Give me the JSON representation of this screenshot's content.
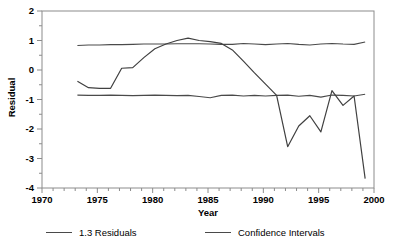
{
  "chart_data": {
    "type": "line",
    "title": "",
    "xlabel": "Year",
    "ylabel": "Residual",
    "xlim": [
      1970,
      2000
    ],
    "ylim": [
      -4,
      2
    ],
    "xticks": [
      1970,
      1975,
      1980,
      1985,
      1990,
      1995,
      2000
    ],
    "yticks": [
      2,
      1,
      0,
      -1,
      -2,
      -3,
      -4
    ],
    "minor_tick_interval_y": 0.5,
    "minor_tick_interval_x": 1,
    "grid": false,
    "legend_position": "below",
    "line_color": "#4a4a4a",
    "frame_color": "#808080",
    "series": [
      {
        "name": "1.3 Residuals",
        "x": [
          1973.2,
          1974.2,
          1975.2,
          1976.2,
          1977.2,
          1978.2,
          1979.2,
          1980.2,
          1981.2,
          1982.2,
          1983.2,
          1984.2,
          1985.2,
          1986.2,
          1987.2,
          1988.2,
          1989.2,
          1990.2,
          1991.2,
          1992.2,
          1993.2,
          1994.2,
          1995.2,
          1996.2,
          1997.2,
          1998.2,
          1999.2
        ],
        "values": [
          -0.38,
          -0.6,
          -0.62,
          -0.62,
          0.06,
          0.08,
          0.42,
          0.72,
          0.88,
          1.0,
          1.08,
          1.0,
          0.96,
          0.9,
          0.68,
          0.3,
          -0.1,
          -0.48,
          -0.86,
          -2.6,
          -1.9,
          -1.55,
          -2.1,
          -0.7,
          -1.2,
          -0.88,
          -3.68
        ]
      },
      {
        "name": "Confidence Intervals Upper",
        "x": [
          1973.2,
          1974.2,
          1975.2,
          1976.2,
          1977.2,
          1978.2,
          1979.2,
          1980.2,
          1981.2,
          1982.2,
          1983.2,
          1984.2,
          1985.2,
          1986.2,
          1987.2,
          1988.2,
          1989.2,
          1990.2,
          1991.2,
          1992.2,
          1993.2,
          1994.2,
          1995.2,
          1996.2,
          1997.2,
          1998.2,
          1999.2
        ],
        "values": [
          0.83,
          0.85,
          0.85,
          0.86,
          0.86,
          0.87,
          0.88,
          0.88,
          0.88,
          0.89,
          0.89,
          0.89,
          0.88,
          0.87,
          0.87,
          0.9,
          0.88,
          0.86,
          0.88,
          0.9,
          0.87,
          0.85,
          0.88,
          0.9,
          0.88,
          0.87,
          0.95
        ]
      },
      {
        "name": "Confidence Intervals Lower",
        "x": [
          1973.2,
          1974.2,
          1975.2,
          1976.2,
          1977.2,
          1978.2,
          1979.2,
          1980.2,
          1981.2,
          1982.2,
          1983.2,
          1984.2,
          1985.2,
          1986.2,
          1987.2,
          1988.2,
          1989.2,
          1990.2,
          1991.2,
          1992.2,
          1993.2,
          1994.2,
          1995.2,
          1996.2,
          1997.2,
          1998.2,
          1999.2
        ],
        "values": [
          -0.85,
          -0.86,
          -0.86,
          -0.85,
          -0.86,
          -0.87,
          -0.86,
          -0.85,
          -0.86,
          -0.87,
          -0.86,
          -0.9,
          -0.94,
          -0.86,
          -0.85,
          -0.88,
          -0.86,
          -0.88,
          -0.86,
          -0.85,
          -0.89,
          -0.86,
          -0.92,
          -0.85,
          -0.86,
          -0.88,
          -0.82
        ]
      }
    ]
  },
  "axes": {
    "y_title": "Residual",
    "x_title": "Year",
    "y_tick_labels": [
      "2",
      "1",
      "0",
      "-1",
      "-2",
      "-3",
      "-4"
    ],
    "x_tick_labels": [
      "1970",
      "1975",
      "1980",
      "1985",
      "1990",
      "1995",
      "2000"
    ]
  },
  "legend": {
    "items": [
      {
        "label": "1.3 Residuals"
      },
      {
        "label": "Confidence Intervals"
      }
    ]
  }
}
